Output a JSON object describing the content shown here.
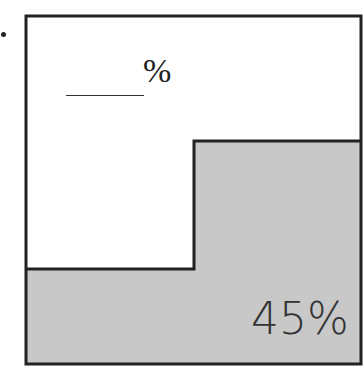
{
  "figure": {
    "bullet": "•",
    "unshaded_label": {
      "blank": "______",
      "suffix": "%"
    },
    "shaded_label": "45%",
    "colors": {
      "shaded": "#c8c8c8",
      "border": "#222222",
      "background": "#ffffff"
    }
  }
}
